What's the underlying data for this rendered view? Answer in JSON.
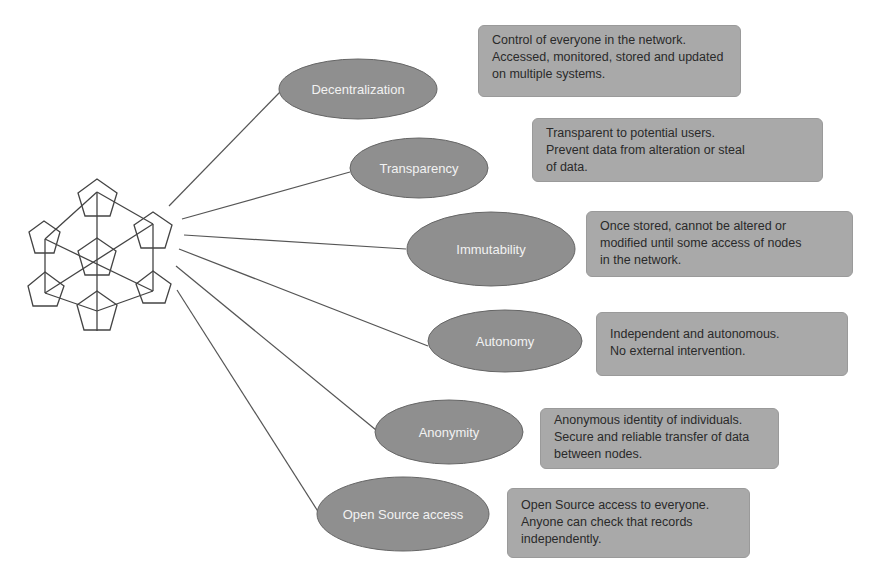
{
  "diagram": {
    "colors": {
      "ellipse_fill": "#8f8f8f",
      "ellipse_stroke": "#666666",
      "ellipse_text": "#f2f2f2",
      "box_fill": "#a9a9a9",
      "box_text": "#2a2a2a",
      "line_color": "#555555",
      "icon_stroke": "#444444",
      "background": "#ffffff"
    },
    "center_icon": "blockchain-network-icon",
    "nodes": [
      {
        "label": "Decentralization",
        "description": [
          "Control of everyone in the network.",
          "Accessed, monitored, stored and updated",
          "on multiple systems."
        ]
      },
      {
        "label": "Transparency",
        "description": [
          "Transparent to potential users.",
          "Prevent data from alteration or steal",
          "of data."
        ]
      },
      {
        "label": "Immutability",
        "description": [
          "Once stored, cannot be altered or",
          "modified until some access of nodes",
          "in the network."
        ]
      },
      {
        "label": "Autonomy",
        "description": [
          "Independent and autonomous.",
          "No external intervention."
        ]
      },
      {
        "label": "Anonymity",
        "description": [
          "Anonymous identity of individuals.",
          "Secure and reliable transfer of data",
          "between nodes."
        ]
      },
      {
        "label": "Open Source access",
        "description": [
          "Open Source access to everyone.",
          "Anyone can check that records",
          "independently."
        ]
      }
    ]
  }
}
